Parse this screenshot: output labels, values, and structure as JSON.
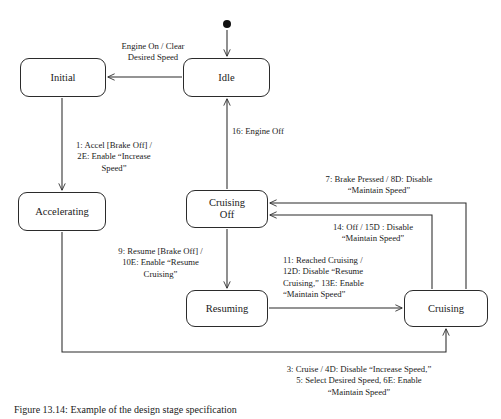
{
  "figure": {
    "caption": "Figure 13.14:  Example of the design stage specification",
    "stroke_color": "#2b2b2b",
    "text_color": "#1a1a1a",
    "background": "#ffffff"
  },
  "diagram": {
    "type": "state-machine",
    "start_node": {
      "name": "initial-pseudostate",
      "x": 227,
      "y": 24
    },
    "states": [
      {
        "id": "initial",
        "label": "Initial",
        "x": 20,
        "y": 58,
        "w": 86,
        "h": 39
      },
      {
        "id": "idle",
        "label": "Idle",
        "x": 183,
        "y": 58,
        "w": 87,
        "h": 39
      },
      {
        "id": "accelerating",
        "label": "Accelerating",
        "x": 18,
        "y": 192,
        "w": 88,
        "h": 39
      },
      {
        "id": "cruising_off",
        "label": "Cruising\nOff",
        "x": 186,
        "y": 190,
        "w": 82,
        "h": 38
      },
      {
        "id": "resuming",
        "label": "Resuming",
        "x": 186,
        "y": 290,
        "w": 82,
        "h": 37
      },
      {
        "id": "cruising",
        "label": "Cruising",
        "x": 404,
        "y": 290,
        "w": 84,
        "h": 37
      }
    ],
    "transitions": [
      {
        "id": "t_idle_initial",
        "from": "idle",
        "to": "initial",
        "label": "Engine On / Clear\nDesired Speed",
        "label_x": 101,
        "label_y": 41,
        "label_w": 104,
        "align": "center"
      },
      {
        "id": "t_initial_accelerating",
        "from": "initial",
        "to": "accelerating",
        "label": "1: Accel [Brake Off] /\n2E: Enable “Increase\nSpeed”",
        "label_x": 55,
        "label_y": 140,
        "label_w": 118,
        "align": "center"
      },
      {
        "id": "t_cruisingoff_idle",
        "from": "cruising_off",
        "to": "idle",
        "label": "16: Engine Off",
        "label_x": 232,
        "label_y": 126,
        "label_w": 80,
        "align": "left"
      },
      {
        "id": "t_cruising_cruisingoff_brake",
        "from": "cruising",
        "to": "cruising_off",
        "label": "7: Brake Pressed / 8D: Disable\n“Maintain Speed”",
        "label_x": 287,
        "label_y": 174,
        "label_w": 184,
        "align": "center"
      },
      {
        "id": "t_cruising_cruisingoff_off",
        "from": "cruising",
        "to": "cruising_off",
        "label": "14: Off / 15D : Disable\n“Maintain Speed”",
        "label_x": 297,
        "label_y": 222,
        "label_w": 152,
        "align": "center"
      },
      {
        "id": "t_cruisingoff_resuming",
        "from": "cruising_off",
        "to": "resuming",
        "label": "9: Resume [Brake Off] /\n10E: Enable “Resume\nCruising”",
        "label_x": 98,
        "label_y": 246,
        "label_w": 125,
        "align": "center"
      },
      {
        "id": "t_resuming_cruising",
        "from": "resuming",
        "to": "cruising",
        "label": "11: Reached Cruising /\n12D: Disable “Resume\nCruising,” 13E: Enable\n“Maintain Speed”",
        "label_x": 283,
        "label_y": 255,
        "label_w": 125,
        "align": "left"
      },
      {
        "id": "t_accelerating_cruising",
        "from": "accelerating",
        "to": "cruising",
        "label": "3: Cruise / 4D: Disable “Increase Speed,”\n5: Select Desired Speed, 6E: Enable\n“Maintain Speed”",
        "label_x": 255,
        "label_y": 364,
        "label_w": 208,
        "align": "center"
      }
    ]
  }
}
